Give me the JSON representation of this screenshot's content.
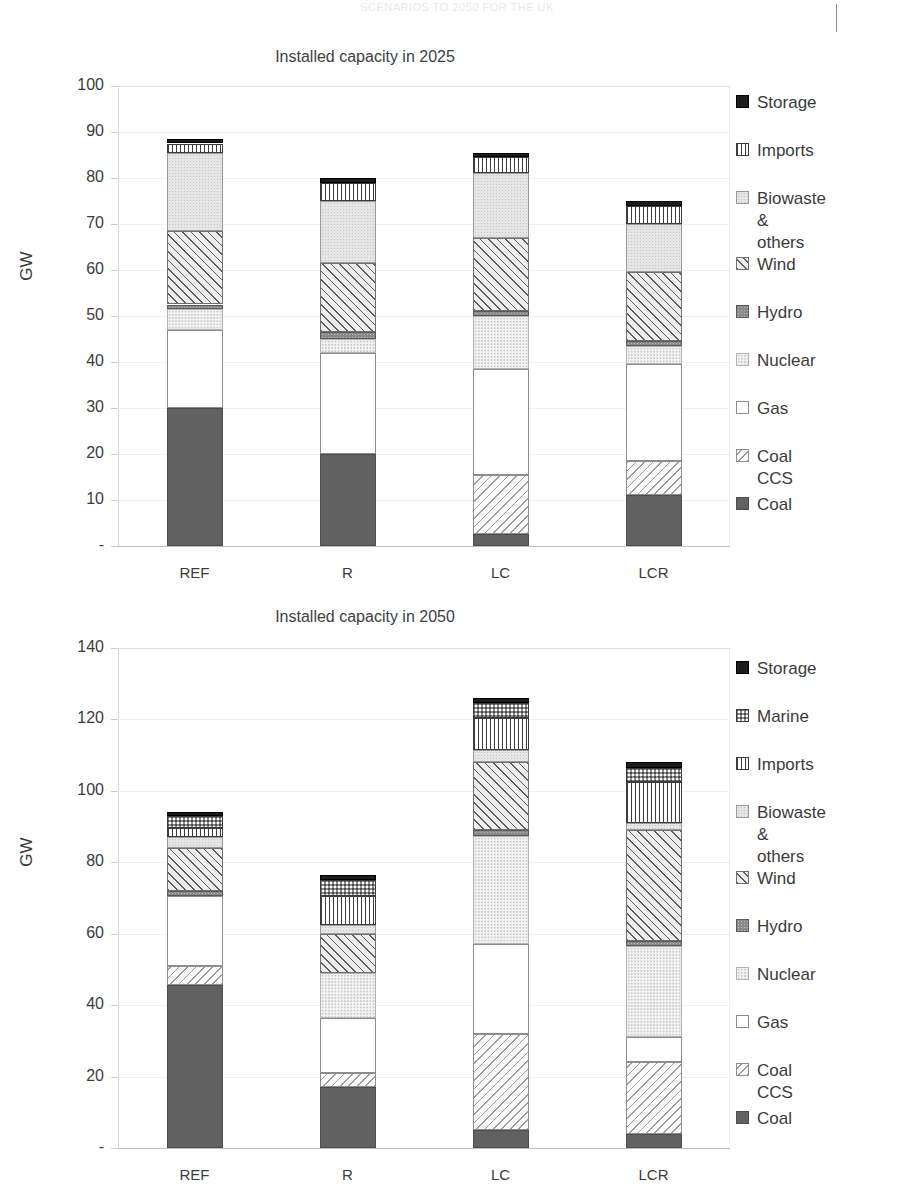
{
  "page": {
    "header_text": "SCENARIOS TO 2050 FOR THE UK",
    "background": "#ffffff"
  },
  "palette": {
    "storage": "#1c1c1c",
    "marine": "#8f8f8f",
    "imports": "#ffffff",
    "biowaste": "#e6e6e6",
    "wind": "#ededed",
    "hydro": "#8a8a8a",
    "nuclear": "#f2f2f2",
    "gas": "#ffffff",
    "coal_ccs": "#fbfbfb",
    "coal": "#616161",
    "axis": "#3b3b3b",
    "grid": "#ededed"
  },
  "chart_data": [
    {
      "id": "chart-2025",
      "type": "bar",
      "stacked": true,
      "title": "Installed capacity in 2025",
      "xlabel": "",
      "ylabel": "GW",
      "ylim": [
        0,
        100
      ],
      "yticks": [
        "-",
        "10",
        "20",
        "30",
        "40",
        "50",
        "60",
        "70",
        "80",
        "90",
        "100"
      ],
      "ytick_values": [
        0,
        10,
        20,
        30,
        40,
        50,
        60,
        70,
        80,
        90,
        100
      ],
      "grid": true,
      "legend_position": "right",
      "categories": [
        "REF",
        "R",
        "LC",
        "LCR"
      ],
      "series": [
        {
          "name": "Coal",
          "key": "coal",
          "values": [
            30.0,
            20.0,
            2.5,
            11.0
          ]
        },
        {
          "name": "Coal CCS",
          "key": "coalccs",
          "values": [
            0.0,
            0.0,
            13.0,
            7.5
          ]
        },
        {
          "name": "Gas",
          "key": "gas",
          "values": [
            17.0,
            22.0,
            23.0,
            21.0
          ]
        },
        {
          "name": "Nuclear",
          "key": "nuclear",
          "values": [
            4.5,
            3.0,
            11.5,
            4.0
          ]
        },
        {
          "name": "Hydro",
          "key": "hydro",
          "values": [
            1.0,
            1.5,
            1.0,
            1.0
          ]
        },
        {
          "name": "Wind",
          "key": "wind",
          "values": [
            16.0,
            15.0,
            16.0,
            15.0
          ]
        },
        {
          "name": "Biowaste & others",
          "key": "biowaste",
          "values": [
            17.0,
            13.5,
            14.0,
            10.5
          ]
        },
        {
          "name": "Imports",
          "key": "imports",
          "values": [
            2.0,
            4.0,
            3.5,
            4.0
          ]
        },
        {
          "name": "Storage",
          "key": "storage",
          "values": [
            1.0,
            1.0,
            1.0,
            1.0
          ]
        }
      ],
      "totals": [
        88.5,
        80.0,
        85.5,
        75.0
      ],
      "legend": [
        {
          "label": "Storage",
          "key": "storage"
        },
        {
          "label": "Imports",
          "key": "imports"
        },
        {
          "label": "Biowaste &\nothers",
          "key": "biowaste"
        },
        {
          "label": "Wind",
          "key": "wind"
        },
        {
          "label": "Hydro",
          "key": "hydro"
        },
        {
          "label": "Nuclear",
          "key": "nuclear"
        },
        {
          "label": "Gas",
          "key": "gas"
        },
        {
          "label": "Coal CCS",
          "key": "coalccs"
        },
        {
          "label": "Coal",
          "key": "coal"
        }
      ]
    },
    {
      "id": "chart-2050",
      "type": "bar",
      "stacked": true,
      "title": "Installed capacity in 2050",
      "xlabel": "",
      "ylabel": "GW",
      "ylim": [
        0,
        140
      ],
      "yticks": [
        "-",
        "20",
        "40",
        "60",
        "80",
        "100",
        "120",
        "140"
      ],
      "ytick_values": [
        0,
        20,
        40,
        60,
        80,
        100,
        120,
        140
      ],
      "grid": true,
      "legend_position": "right",
      "categories": [
        "REF",
        "R",
        "LC",
        "LCR"
      ],
      "series": [
        {
          "name": "Coal",
          "key": "coal",
          "values": [
            45.5,
            17.0,
            5.0,
            4.0
          ]
        },
        {
          "name": "Coal CCS",
          "key": "coalccs",
          "values": [
            5.5,
            4.0,
            27.0,
            20.0
          ]
        },
        {
          "name": "Gas",
          "key": "gas",
          "values": [
            19.5,
            15.5,
            25.0,
            7.0
          ]
        },
        {
          "name": "Nuclear",
          "key": "nuclear",
          "values": [
            0.0,
            12.5,
            30.5,
            25.5
          ]
        },
        {
          "name": "Hydro",
          "key": "hydro",
          "values": [
            1.5,
            0.0,
            1.5,
            1.5
          ]
        },
        {
          "name": "Wind",
          "key": "wind",
          "values": [
            12.0,
            11.0,
            19.0,
            31.0
          ]
        },
        {
          "name": "Biowaste & others",
          "key": "biowaste",
          "values": [
            3.0,
            2.5,
            3.5,
            2.0
          ]
        },
        {
          "name": "Imports",
          "key": "imports",
          "values": [
            2.5,
            8.0,
            9.0,
            11.5
          ]
        },
        {
          "name": "Marine",
          "key": "marine",
          "values": [
            3.5,
            4.5,
            4.0,
            4.0
          ]
        },
        {
          "name": "Storage",
          "key": "storage",
          "values": [
            1.0,
            1.5,
            1.5,
            1.5
          ]
        }
      ],
      "totals": [
        98.0,
        77.5,
        126.0,
        108.0
      ],
      "legend": [
        {
          "label": "Storage",
          "key": "storage"
        },
        {
          "label": "Marine",
          "key": "marine"
        },
        {
          "label": "Imports",
          "key": "imports"
        },
        {
          "label": "Biowaste &\nothers",
          "key": "biowaste"
        },
        {
          "label": "Wind",
          "key": "wind"
        },
        {
          "label": "Hydro",
          "key": "hydro"
        },
        {
          "label": "Nuclear",
          "key": "nuclear"
        },
        {
          "label": "Gas",
          "key": "gas"
        },
        {
          "label": "Coal CCS",
          "key": "coalccs"
        },
        {
          "label": "Coal",
          "key": "coal"
        }
      ]
    }
  ]
}
